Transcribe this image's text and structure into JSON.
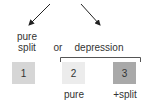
{
  "diagram": {
    "arrows": [
      {
        "name": "left-arrow",
        "from": [
          50,
          5
        ],
        "to": [
          28,
          26
        ]
      },
      {
        "name": "right-arrow",
        "from": [
          80,
          5
        ],
        "to": [
          100,
          26
        ]
      }
    ],
    "labels": {
      "pure_split_line1": "pure",
      "pure_split_line2": "split",
      "or": "or",
      "depression": "depression"
    },
    "boxes": [
      {
        "id": "1",
        "label": "1",
        "color": "#d6d6d6",
        "caption": ""
      },
      {
        "id": "2",
        "label": "2",
        "color": "#ececec",
        "caption": "pure"
      },
      {
        "id": "3",
        "label": "3",
        "color": "#a9a9a9",
        "caption": "+split"
      }
    ],
    "bracket_color": "#555555",
    "arrow_color": "#222222"
  }
}
